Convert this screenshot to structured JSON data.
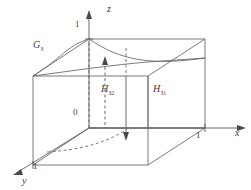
{
  "figure": {
    "kind": "3d-unit-cube-diagram",
    "stroke_color": "#6b6b6b",
    "text_color": "#3a3a3a",
    "background": "#ffffff",
    "axes": [
      {
        "id": "z",
        "label": "z",
        "direction": "up",
        "tick_label": "1"
      },
      {
        "id": "x",
        "label": "x",
        "direction": "right",
        "tick_label": "1"
      },
      {
        "id": "y",
        "label": "y",
        "direction": "down-left",
        "tick_label": "1"
      }
    ],
    "origin_label": "0",
    "ticks": {
      "z": "1",
      "x": "1",
      "y": "1"
    },
    "regions": [
      {
        "id": "G3",
        "base": "G",
        "subscript": "3",
        "description": "curved surface on upper part of cube"
      },
      {
        "id": "H32",
        "base": "H",
        "subscript": "32",
        "description": "interior region with up and down arrows"
      },
      {
        "id": "H31",
        "base": "H",
        "subscript": "31",
        "description": "region on right face of cube"
      }
    ],
    "arrows": [
      {
        "id": "up-arrow",
        "style": "dashed",
        "direction": "up",
        "region": "H32"
      },
      {
        "id": "down-arrow",
        "style": "solid",
        "direction": "down",
        "region": "H32"
      }
    ],
    "curves": [
      {
        "id": "top-curve",
        "style": "solid",
        "description": "G3 boundary curve across top face"
      },
      {
        "id": "bottom-curve",
        "style": "dashed",
        "description": "projection curve on bottom face"
      }
    ]
  }
}
